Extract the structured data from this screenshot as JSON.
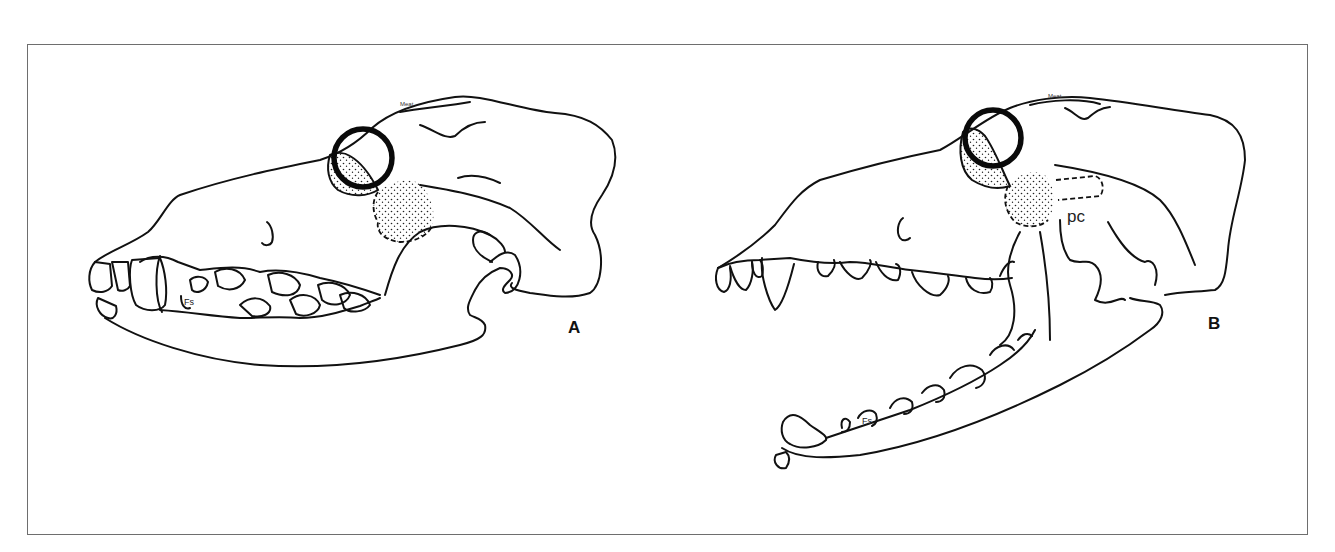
{
  "figure": {
    "panels": [
      {
        "id": "A",
        "label": "A",
        "description": "Dog skull, lateral view, jaw closed",
        "tooth_label": "Fs",
        "skull_annotation": "Meat"
      },
      {
        "id": "B",
        "label": "B",
        "description": "Dog skull, lateral view, jaw open",
        "tooth_label": "Fs",
        "skull_annotation": "Meat",
        "structure_label": "pc"
      }
    ],
    "colors": {
      "line": "#111111",
      "frame": "#6e6e6e",
      "background": "#ffffff"
    }
  }
}
